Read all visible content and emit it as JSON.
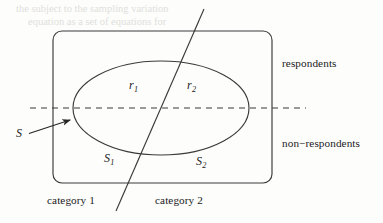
{
  "figure": {
    "type": "venn-partition-diagram",
    "ink_color": "#262626",
    "background_color": "#fdfdfc"
  },
  "labels": {
    "respondents": "respondents",
    "non_respondents": "non−respondents",
    "category_1": "category 1",
    "category_2": "category 2",
    "sample_s": "S",
    "r1_base": "r",
    "r1_sub": "1",
    "r2_base": "r",
    "r2_sub": "2",
    "s1_base": "S",
    "s1_sub": "1",
    "s2_base": "S",
    "s2_sub": "2"
  },
  "geometry": {
    "rectangle": {
      "x": 53,
      "y": 31,
      "width": 219,
      "height": 152,
      "corner_radius": 9
    },
    "ellipse": {
      "cx": 161,
      "cy": 108,
      "rx": 88,
      "ry": 47
    },
    "dashed_line": {
      "x1": 30,
      "y1": 108,
      "x2": 306,
      "y2": 108
    },
    "diagonal_line": {
      "x1": 204,
      "y1": 9,
      "x2": 116,
      "y2": 211
    },
    "arrow": {
      "x1": 29,
      "y1": 133,
      "x2": 73,
      "y2": 119
    }
  },
  "ghost_text": {
    "lines": [
      "the    subject   to   the    sampling   variation",
      "equation    as    a   set    of    equations   for"
    ]
  }
}
